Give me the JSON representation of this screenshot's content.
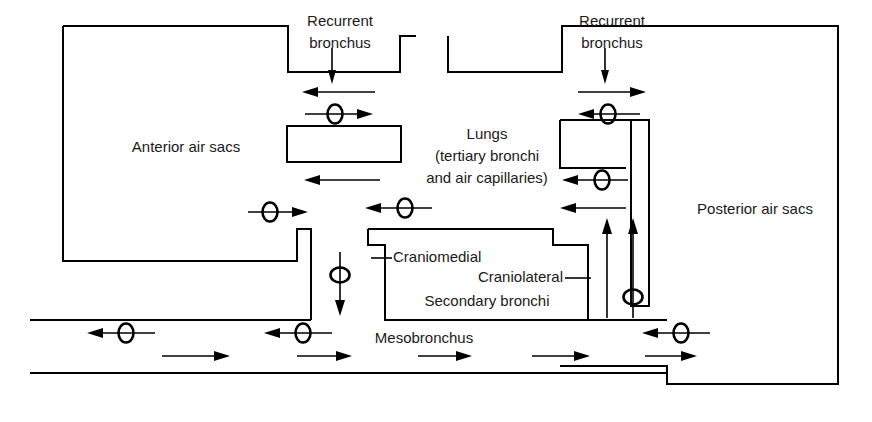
{
  "figure": {
    "background_color": "#ffffff",
    "line_color": "#000000",
    "text_color": "#1a1a1a",
    "width": 872,
    "height": 422
  },
  "labels": {
    "anterior_air_sacs": "Anterior air sacs",
    "posterior_air_sacs": "Posterior air sacs",
    "recurrent_bronchus_left": "Recurrent",
    "recurrent_bronchus_left2": "bronchus",
    "recurrent_bronchus_right": "Recurrent",
    "recurrent_bronchus_right2": "bronchus",
    "lungs_line1": "Lungs",
    "lungs_line2": "(tertiary bronchi",
    "lungs_line3": "and air capillaries)",
    "craniomedial": "Craniomedial",
    "craniolateral": "Craniolateral",
    "secondary_bronchi": "Secondary bronchi",
    "mesobronchus": "Mesobronchus"
  },
  "diagram_data": {
    "type": "flow-diagram",
    "compartments": [
      {
        "name": "anterior-air-sacs",
        "label": "Anterior air sacs",
        "side": "left"
      },
      {
        "name": "posterior-air-sacs",
        "label": "Posterior air sacs",
        "side": "right"
      },
      {
        "name": "lungs",
        "label": "Lungs (tertiary bronchi and air capillaries)",
        "side": "center"
      },
      {
        "name": "secondary-bronchi",
        "label": "Secondary bronchi",
        "side": "center-bottom"
      },
      {
        "name": "mesobronchus",
        "label": "Mesobronchus",
        "side": "bottom"
      }
    ],
    "flow_markers": [
      {
        "id": "m1",
        "direction": "left",
        "valve": false,
        "region": "recurrent-bronchus-left",
        "x": 340,
        "y": 90
      },
      {
        "id": "m2",
        "direction": "right",
        "valve": true,
        "region": "recurrent-bronchus-left",
        "x": 340,
        "y": 113
      },
      {
        "id": "m3",
        "direction": "right",
        "valve": false,
        "region": "recurrent-bronchus-right",
        "x": 612,
        "y": 90
      },
      {
        "id": "m4",
        "direction": "left",
        "valve": true,
        "region": "recurrent-bronchus-right",
        "x": 612,
        "y": 113
      },
      {
        "id": "m5",
        "direction": "left",
        "valve": false,
        "region": "anterior-sac-outflow",
        "x": 340,
        "y": 180
      },
      {
        "id": "m6",
        "direction": "left",
        "valve": true,
        "region": "lung-to-anterior",
        "x": 612,
        "y": 180
      },
      {
        "id": "m7",
        "direction": "right",
        "valve": true,
        "region": "anterior-sac-inflow",
        "x": 273,
        "y": 212
      },
      {
        "id": "m8",
        "direction": "left",
        "valve": true,
        "region": "craniomedial-outflow",
        "x": 404,
        "y": 207
      },
      {
        "id": "m9",
        "direction": "left",
        "valve": false,
        "region": "craniolateral-outflow",
        "x": 590,
        "y": 207
      },
      {
        "id": "m10",
        "direction": "down",
        "valve": true,
        "region": "mesobronchus-to-anterior",
        "x": 340,
        "y": 285
      },
      {
        "id": "m11",
        "direction": "up",
        "valve": false,
        "region": "posterior-to-lung-a",
        "x": 610,
        "y": 275
      },
      {
        "id": "m12",
        "direction": "up",
        "valve": true,
        "region": "posterior-to-lung-b",
        "x": 636,
        "y": 275
      },
      {
        "id": "m13",
        "direction": "left",
        "valve": true,
        "region": "mesobronchus-exhale-1",
        "x": 122,
        "y": 332
      },
      {
        "id": "m14",
        "direction": "left",
        "valve": true,
        "region": "mesobronchus-exhale-2",
        "x": 300,
        "y": 332
      },
      {
        "id": "m15",
        "direction": "left",
        "valve": true,
        "region": "mesobronchus-exhale-3",
        "x": 680,
        "y": 332
      },
      {
        "id": "m16",
        "direction": "right",
        "valve": false,
        "region": "mesobronchus-inhale-1",
        "x": 200,
        "y": 355
      },
      {
        "id": "m17",
        "direction": "right",
        "valve": false,
        "region": "mesobronchus-inhale-2",
        "x": 330,
        "y": 355
      },
      {
        "id": "m18",
        "direction": "right",
        "valve": false,
        "region": "mesobronchus-inhale-3",
        "x": 450,
        "y": 355
      },
      {
        "id": "m19",
        "direction": "right",
        "valve": false,
        "region": "mesobronchus-inhale-4",
        "x": 580,
        "y": 355
      },
      {
        "id": "m20",
        "direction": "right",
        "valve": false,
        "region": "mesobronchus-inhale-5",
        "x": 680,
        "y": 355
      },
      {
        "id": "m21",
        "direction": "down",
        "valve": false,
        "region": "recurrent-left-entry",
        "x": 340,
        "y": 60
      },
      {
        "id": "m22",
        "direction": "down",
        "valve": false,
        "region": "recurrent-right-entry",
        "x": 612,
        "y": 60
      }
    ]
  }
}
